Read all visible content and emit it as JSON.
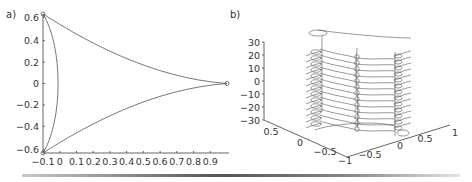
{
  "chart_data": [
    {
      "panel_label": "a)",
      "type": "line",
      "title": "",
      "xlabel": "",
      "ylabel": "",
      "xlim": [
        -0.1,
        1.0
      ],
      "ylim": [
        -0.65,
        0.65
      ],
      "x_ticks": [
        "-0.1",
        "0",
        "0.1",
        "0.2",
        "0.3",
        "0.4",
        "0.5",
        "0.6",
        "0.7",
        "0.8",
        "0.9"
      ],
      "y_ticks": [
        "0.6",
        "0.4",
        "0.2",
        "0",
        "-0.2",
        "-0.4",
        "-0.6"
      ],
      "grid": false,
      "legend": null,
      "description": "Deltoid-like closed curve (hypocycloid with 3 cusps) with cusps at (-0.1, 0.65), (-0.1, -0.65) and (1.0, 0); left side bulges to x≈0 at y=0; small circle markers at the cusps",
      "series": [
        {
          "name": "curve",
          "points": [
            [
              -0.1,
              0.65
            ],
            [
              0.1,
              0.47
            ],
            [
              0.3,
              0.31
            ],
            [
              0.5,
              0.18
            ],
            [
              0.7,
              0.08
            ],
            [
              0.9,
              0.02
            ],
            [
              1.0,
              0.0
            ],
            [
              0.9,
              -0.02
            ],
            [
              0.7,
              -0.08
            ],
            [
              0.5,
              -0.18
            ],
            [
              0.3,
              -0.31
            ],
            [
              0.1,
              -0.47
            ],
            [
              -0.1,
              -0.65
            ],
            [
              -0.04,
              -0.4
            ],
            [
              0.0,
              0.0
            ],
            [
              -0.04,
              0.4
            ],
            [
              -0.1,
              0.65
            ]
          ]
        }
      ],
      "markers": [
        [
          -0.1,
          0.65
        ],
        [
          -0.1,
          -0.65
        ],
        [
          1.0,
          0.0
        ]
      ]
    },
    {
      "panel_label": "b)",
      "type": "line",
      "title": "",
      "xlabel": "",
      "ylabel": "",
      "zlim": [
        -30,
        30
      ],
      "z_ticks": [
        "30",
        "20",
        "10",
        "0",
        "-10",
        "-20",
        "-30"
      ],
      "y_ticks": [
        "0.5",
        "0",
        "-0.5"
      ],
      "x_ticks": [
        "-1",
        "-0.5",
        "0",
        "0.5",
        "1"
      ],
      "grid": false,
      "legend": null,
      "description": "3D plot of the deltoid-shaped cross sections stacked along z from -30 to 30, with looping curves connecting the three cusp columns"
    }
  ],
  "panels": {
    "a": {
      "label": "a)"
    },
    "b": {
      "label": "b)"
    }
  }
}
